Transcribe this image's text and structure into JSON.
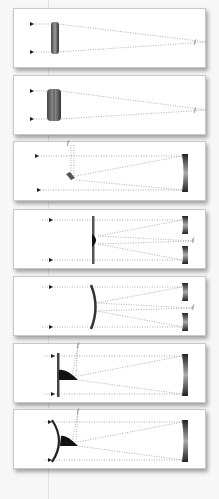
{
  "colors": {
    "background": "#f7f7f7",
    "panel": "#ffffff",
    "ray": "#9a9a9a",
    "optic_dark": "#2a2a2a",
    "arrow": "#1a1a1a"
  },
  "panels": [
    {
      "id": "refractor-achromat",
      "type": "refractor",
      "focus_label": "f",
      "optic": "single lens"
    },
    {
      "id": "refractor-doublet",
      "type": "refractor",
      "focus_label": "f",
      "optic": "doublet lens"
    },
    {
      "id": "newtonian",
      "type": "reflector",
      "focus_label": "f",
      "optic": "primary mirror + diagonal"
    },
    {
      "id": "schmidt-cassegrain",
      "type": "catadioptric",
      "focus_label": "f",
      "optic": "corrector plate + primary + secondary"
    },
    {
      "id": "maksutov-cassegrain",
      "type": "catadioptric",
      "focus_label": "f",
      "optic": "meniscus corrector + primary"
    },
    {
      "id": "schmidt-newtonian",
      "type": "catadioptric",
      "focus_label": "f",
      "optic": "corrector + diagonal"
    },
    {
      "id": "maksutov-newtonian",
      "type": "catadioptric",
      "focus_label": "f",
      "optic": "meniscus + diagonal"
    }
  ]
}
